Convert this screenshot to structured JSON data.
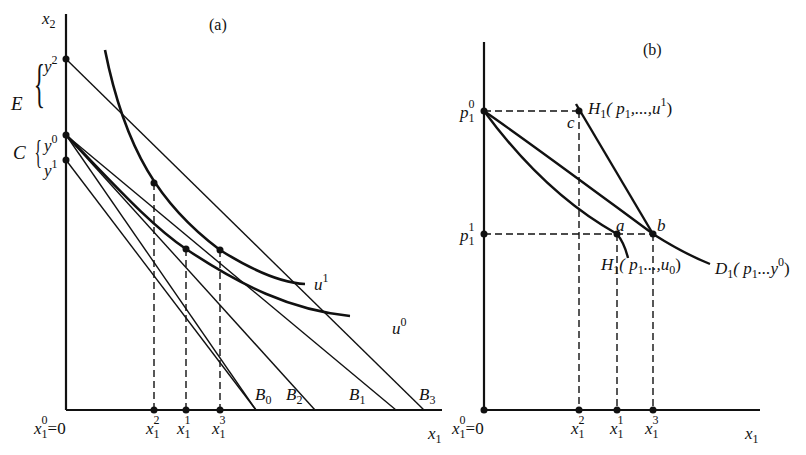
{
  "figure": {
    "caption_visible": false
  },
  "panel_a": {
    "tag": "(a)",
    "y_axis_label": {
      "base": "x",
      "sub": "2"
    },
    "x_axis_label": {
      "base": "x",
      "sub": "1"
    },
    "origin_label": {
      "base": "x",
      "sub": "1",
      "sup": "0",
      "suffix": "=0"
    },
    "income_levels": [
      {
        "base": "y",
        "sup": "2"
      },
      {
        "base": "y",
        "sup": "0"
      },
      {
        "base": "y",
        "sup": "1"
      }
    ],
    "brace_labels": {
      "E": "E",
      "C": "C"
    },
    "indifference_curves": [
      {
        "base": "u",
        "sup": "1"
      },
      {
        "base": "u",
        "sup": "0"
      }
    ],
    "budget_lines": [
      {
        "base": "B",
        "sub": "0"
      },
      {
        "base": "B",
        "sub": "2"
      },
      {
        "base": "B",
        "sub": "1"
      },
      {
        "base": "B",
        "sub": "3"
      }
    ],
    "x_ticks": [
      {
        "base": "x",
        "sub": "1",
        "sup": "2"
      },
      {
        "base": "x",
        "sub": "1",
        "sup": "1"
      },
      {
        "base": "x",
        "sub": "1",
        "sup": "3"
      }
    ]
  },
  "panel_b": {
    "tag": "(b)",
    "x_axis_label": {
      "base": "x",
      "sub": "1"
    },
    "origin_label": {
      "base": "x",
      "sub": "1",
      "sup": "0",
      "suffix": "=0"
    },
    "price_levels": [
      {
        "base": "p",
        "sub": "1",
        "sup": "0"
      },
      {
        "base": "p",
        "sub": "1",
        "sup": "1"
      }
    ],
    "points": {
      "a": "a",
      "b": "b",
      "c": "c"
    },
    "curves": {
      "hicks_u1": {
        "name": "H",
        "sub": "1",
        "args": "( p",
        "args_sub": "1",
        "args_rest": ",...,u",
        "args_sup": "1",
        "close": ")"
      },
      "hicks_u0": {
        "name": "H",
        "sub": "1",
        "args": "( p",
        "args_sub": "1",
        "args_rest": "...,u",
        "args_sub2": "0",
        "close": ")"
      },
      "marshall": {
        "name": "D",
        "sub": "1",
        "args": "( p",
        "args_sub": "1",
        "args_rest": "...y",
        "args_sup": "0",
        "close": ")"
      }
    },
    "x_ticks": [
      {
        "base": "x",
        "sub": "1",
        "sup": "2"
      },
      {
        "base": "x",
        "sub": "1",
        "sup": "1"
      },
      {
        "base": "x",
        "sub": "1",
        "sup": "3"
      }
    ]
  }
}
